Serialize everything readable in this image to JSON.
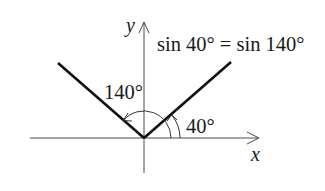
{
  "diagram": {
    "type": "unit-angle-diagram",
    "equation": "sin 40° = sin 140°",
    "axes": {
      "x_label": "x",
      "y_label": "y"
    },
    "angles": [
      {
        "label": "40°",
        "degrees": 40
      },
      {
        "label": "140°",
        "degrees": 140
      }
    ],
    "colors": {
      "rays": "#111111",
      "axes": "#4a4a4a",
      "text": "#1a1a1a",
      "background": "#ffffff"
    }
  }
}
